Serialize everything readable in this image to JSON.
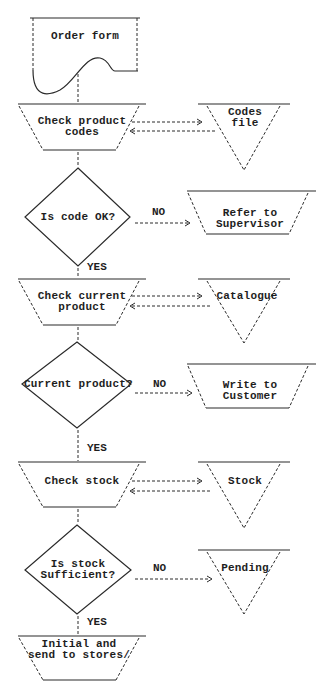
{
  "diagram": {
    "type": "flowchart",
    "start": {
      "label": "Order form",
      "shape": "document"
    },
    "steps": [
      {
        "process": {
          "label": "Check product\ncodes",
          "shape": "manual-operation"
        },
        "store": {
          "label": "Codes\nfile",
          "shape": "offline-storage"
        },
        "link": "bidirectional"
      },
      {
        "decision": {
          "label": "Is code OK?",
          "no_label": "NO",
          "yes_label": "YES"
        },
        "no_target": {
          "label": "Refer to\nSupervisor",
          "shape": "manual-operation"
        }
      },
      {
        "process": {
          "label": "Check current\nproduct",
          "shape": "manual-operation"
        },
        "store": {
          "label": "Catalogue",
          "shape": "offline-storage"
        },
        "link": "bidirectional"
      },
      {
        "decision": {
          "label": "Current product?",
          "no_label": "NO",
          "yes_label": "YES"
        },
        "no_target": {
          "label": "Write to\nCustomer",
          "shape": "manual-operation"
        }
      },
      {
        "process": {
          "label": "Check stock",
          "shape": "manual-operation"
        },
        "store": {
          "label": "Stock",
          "shape": "offline-storage"
        },
        "link": "bidirectional"
      },
      {
        "decision": {
          "label": "Is stock\nSufficient?",
          "no_label": "NO",
          "yes_label": "YES"
        },
        "no_target": {
          "label": "Pending",
          "shape": "offline-storage"
        }
      },
      {
        "process": {
          "label": "Initial and\nsend to stores/",
          "shape": "manual-operation"
        }
      }
    ]
  },
  "labels": {
    "order_form": "Order form",
    "check_codes": "Check product\ncodes",
    "codes_file": "Codes\nfile",
    "is_code_ok": "Is code OK?",
    "refer_supervisor": "Refer to\nSupervisor",
    "check_current": "Check current\nproduct",
    "catalogue": "Catalogue",
    "current_product": "Current product?",
    "write_customer": "Write to\nCustomer",
    "check_stock": "Check stock",
    "stock": "Stock",
    "is_stock_sufficient": "Is stock\nSufficient?",
    "pending": "Pending",
    "initial_send": "Initial and\nsend to stores/",
    "no": "NO",
    "yes": "YES"
  },
  "colors": {
    "ink": "#2a2a2a",
    "background": "#ffffff"
  }
}
